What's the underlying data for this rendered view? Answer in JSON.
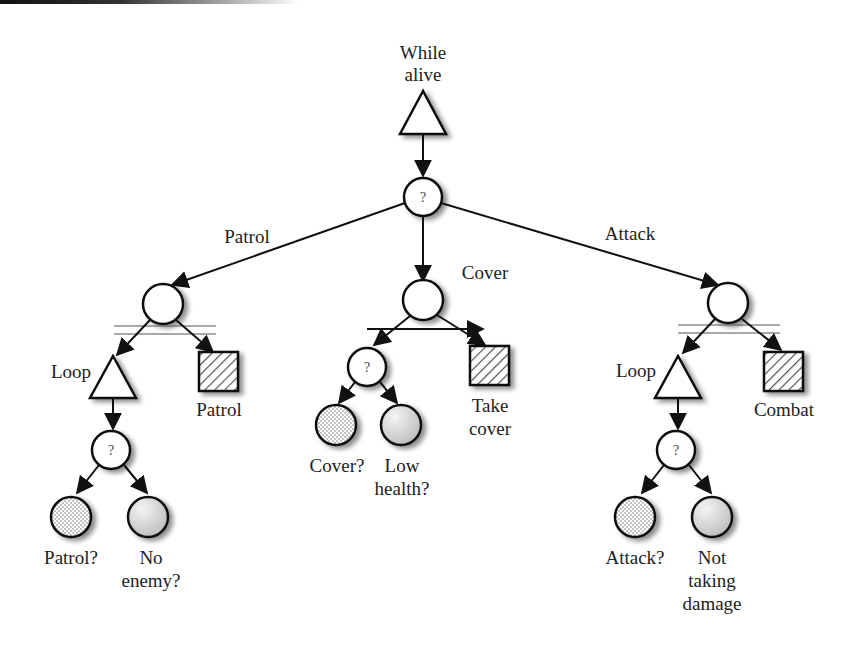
{
  "diagram": {
    "type": "behavior-tree",
    "root": {
      "id": "while-alive",
      "shape": "triangle",
      "label_lines": [
        "While",
        "alive"
      ]
    },
    "selector": {
      "id": "root-selector",
      "shape": "circle",
      "symbol": "?"
    },
    "branch_labels": {
      "patrol": "Patrol",
      "cover": "Cover",
      "attack": "Attack"
    },
    "branches": [
      {
        "id": "patrol",
        "parallel_node": "circle",
        "loop_label": "Loop",
        "action_label": "Patrol",
        "selector_symbol": "?",
        "conditions": [
          {
            "label_lines": [
              "Patrol?"
            ],
            "fill": "dotted"
          },
          {
            "label_lines": [
              "No",
              "enemy?"
            ],
            "fill": "gradient"
          }
        ]
      },
      {
        "id": "cover",
        "parallel_node": "circle",
        "selector_symbol": "?",
        "action_label_lines": [
          "Take",
          "cover"
        ],
        "conditions": [
          {
            "label_lines": [
              "Cover?"
            ],
            "fill": "dotted"
          },
          {
            "label_lines": [
              "Low",
              "health?"
            ],
            "fill": "gradient"
          }
        ]
      },
      {
        "id": "attack",
        "parallel_node": "circle",
        "loop_label": "Loop",
        "action_label": "Combat",
        "selector_symbol": "?",
        "conditions": [
          {
            "label_lines": [
              "Attack?"
            ],
            "fill": "dotted"
          },
          {
            "label_lines": [
              "Not",
              "taking",
              "damage"
            ],
            "fill": "gradient"
          }
        ]
      }
    ],
    "colors": {
      "stroke": "#111111",
      "text": "#222222",
      "hatch": "#555555",
      "dots": "#777777",
      "gradient_light": "#f4f4f4",
      "gradient_dark": "#bdbdbd"
    }
  }
}
